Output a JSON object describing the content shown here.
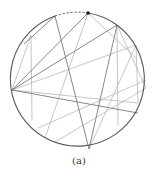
{
  "figure": {
    "caption": "(a)",
    "circle": {
      "cx": 79,
      "cy": 83,
      "r": 67,
      "stroke": "#555555"
    },
    "dashed_arc": {
      "from": [
        55,
        16
      ],
      "to": [
        88,
        13
      ],
      "stroke": "#333333"
    },
    "marker": {
      "x": 88,
      "y": 13,
      "color": "#111111"
    },
    "chords_dark": [
      [
        [
          55,
          16
        ],
        [
          89,
          149
        ]
      ],
      [
        [
          88,
          13
        ],
        [
          12,
          90
        ]
      ],
      [
        [
          117,
          25
        ],
        [
          12,
          90
        ]
      ],
      [
        [
          12,
          90
        ],
        [
          138,
          113
        ]
      ],
      [
        [
          117,
          25
        ],
        [
          89,
          149
        ]
      ],
      [
        [
          24,
          44
        ],
        [
          55,
          16
        ]
      ]
    ],
    "chords_light": [
      [
        [
          88,
          13
        ],
        [
          136,
          58
        ]
      ],
      [
        [
          88,
          13
        ],
        [
          45,
          138
        ]
      ],
      [
        [
          117,
          25
        ],
        [
          118,
          126
        ]
      ],
      [
        [
          136,
          45
        ],
        [
          12,
          90
        ]
      ],
      [
        [
          136,
          45
        ],
        [
          89,
          149
        ]
      ],
      [
        [
          136,
          45
        ],
        [
          138,
          103
        ]
      ],
      [
        [
          31,
          35
        ],
        [
          32,
          120
        ]
      ],
      [
        [
          31,
          35
        ],
        [
          12,
          90
        ]
      ],
      [
        [
          146,
          80
        ],
        [
          38,
          128
        ]
      ],
      [
        [
          146,
          88
        ],
        [
          55,
          142
        ]
      ],
      [
        [
          117,
          25
        ],
        [
          146,
          88
        ]
      ],
      [
        [
          138,
          103
        ],
        [
          12,
          90
        ]
      ]
    ]
  }
}
